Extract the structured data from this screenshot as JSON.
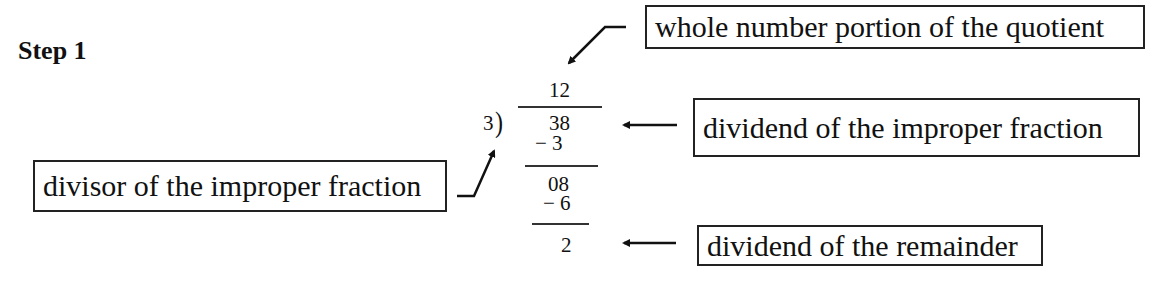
{
  "title": "Step 1",
  "division": {
    "quotient": "12",
    "divisor": "3",
    "bracket": ")",
    "dividend": "38",
    "first_subtraction": "− 3",
    "second_line": "08",
    "second_subtraction": "− 6",
    "remainder": "2"
  },
  "labels": {
    "quotient_label": "whole number portion of the quotient",
    "dividend_label": "dividend of the improper fraction",
    "divisor_label": "divisor of the improper fraction",
    "remainder_label": "dividend of the remainder"
  }
}
